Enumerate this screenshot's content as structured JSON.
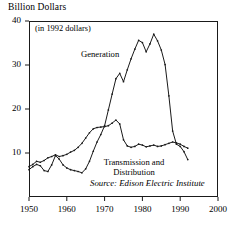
{
  "chart_data": {
    "type": "line",
    "title": "Billion Dollars",
    "subtitle": "(in 1992 dollars)",
    "xlabel": "",
    "ylabel": "Billion Dollars",
    "source": "Source: Edison Electric Institute",
    "grid": false,
    "legend_position": "inline-annotations",
    "xlim": [
      1950,
      2000
    ],
    "ylim": [
      0,
      40
    ],
    "xticks": [
      1950,
      1960,
      1970,
      1980,
      1990,
      2000
    ],
    "yticks": [
      10,
      20,
      30,
      40
    ],
    "xtick_labels": [
      "1950",
      "1960",
      "1970",
      "1980",
      "1990",
      "2000"
    ],
    "ytick_labels": [
      "10",
      "20",
      "30",
      "40"
    ],
    "series": [
      {
        "name": "Generation",
        "label": "Generation",
        "color": "#1a1a1a",
        "x": [
          1950,
          1951,
          1952,
          1953,
          1954,
          1955,
          1956,
          1957,
          1958,
          1959,
          1960,
          1961,
          1962,
          1963,
          1964,
          1965,
          1966,
          1967,
          1968,
          1969,
          1970,
          1971,
          1972,
          1973,
          1974,
          1975,
          1976,
          1977,
          1978,
          1979,
          1980,
          1981,
          1982,
          1983,
          1984,
          1985,
          1986,
          1987,
          1988,
          1989,
          1990,
          1991,
          1992
        ],
        "values": [
          6.2,
          6.9,
          7.4,
          7.1,
          6.0,
          5.8,
          7.3,
          9.4,
          8.6,
          7.3,
          6.6,
          6.2,
          6.0,
          5.8,
          5.5,
          6.4,
          8.1,
          10.4,
          12.5,
          14.2,
          16.2,
          19.8,
          23.4,
          26.9,
          28.1,
          26.2,
          28.9,
          31.4,
          33.6,
          35.6,
          35.1,
          33.0,
          34.8,
          37.0,
          35.5,
          33.4,
          30.1,
          23.0,
          15.0,
          12.0,
          11.5,
          10.3,
          8.5
        ]
      },
      {
        "name": "Transmission and Distribution",
        "label": "Transmission and Distribution",
        "color": "#1a1a1a",
        "x": [
          1950,
          1951,
          1952,
          1953,
          1954,
          1955,
          1956,
          1957,
          1958,
          1959,
          1960,
          1961,
          1962,
          1963,
          1964,
          1965,
          1966,
          1967,
          1968,
          1969,
          1970,
          1971,
          1972,
          1973,
          1974,
          1975,
          1976,
          1977,
          1978,
          1979,
          1980,
          1981,
          1982,
          1983,
          1984,
          1985,
          1986,
          1987,
          1988,
          1989,
          1990,
          1991,
          1992
        ],
        "values": [
          6.9,
          7.4,
          8.1,
          7.9,
          8.3,
          8.9,
          9.2,
          9.6,
          9.2,
          9.4,
          9.7,
          10.2,
          10.6,
          11.3,
          12.2,
          13.4,
          14.6,
          15.5,
          15.8,
          15.9,
          16.0,
          16.2,
          16.8,
          17.5,
          16.6,
          13.0,
          11.6,
          11.3,
          11.5,
          12.0,
          11.8,
          11.4,
          11.6,
          11.8,
          11.5,
          11.6,
          11.9,
          12.2,
          12.5,
          12.3,
          12.0,
          11.5,
          11.1
        ]
      }
    ],
    "annotations": [
      {
        "text": "(in 1992 dollars)",
        "x": 1952,
        "y": 37.5
      },
      {
        "text": "Generation",
        "x": 1964,
        "y": 31.5
      },
      {
        "text": "Transmission and",
        "x": 1975,
        "y": 8.8
      },
      {
        "text": "Distribution",
        "x": 1975,
        "y": 7.2
      },
      {
        "text": "Source: Edison Electric Institute",
        "x": 1979,
        "y": 3.2
      }
    ]
  },
  "labels": {
    "axis_title": "Billion Dollars",
    "subtitle": "(in 1992 dollars)",
    "generation": "Generation",
    "transmission_line1": "Transmission and",
    "transmission_line2": "Distribution",
    "source": "Source: Edison Electric Institute"
  }
}
